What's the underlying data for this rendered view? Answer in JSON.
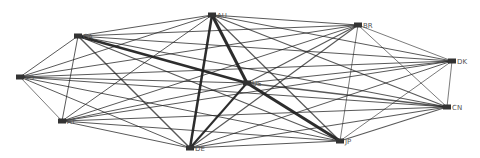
{
  "diagram": {
    "type": "network-graph",
    "node_color": "#333333",
    "label_color": "#555555",
    "edge_color": "#222222",
    "nodes": [
      {
        "id": "AU",
        "label": "AU",
        "x": 212,
        "y": 15
      },
      {
        "id": "CA",
        "label": "CA",
        "x": 78,
        "y": 36
      },
      {
        "id": "ES",
        "label": "ES",
        "x": 20,
        "y": 77
      },
      {
        "id": "AT",
        "label": "AT",
        "x": 62,
        "y": 121
      },
      {
        "id": "DE",
        "label": "DE",
        "x": 190,
        "y": 148
      },
      {
        "id": "US",
        "label": "US",
        "x": 247,
        "y": 83
      },
      {
        "id": "BR",
        "label": "BR",
        "x": 358,
        "y": 25
      },
      {
        "id": "DK",
        "label": "DK",
        "x": 452,
        "y": 61
      },
      {
        "id": "CN",
        "label": "CN",
        "x": 447,
        "y": 107
      },
      {
        "id": "JP",
        "label": "JP",
        "x": 340,
        "y": 141
      }
    ],
    "edges": [
      {
        "source": "AU",
        "target": "CA",
        "weight": 1
      },
      {
        "source": "AU",
        "target": "ES",
        "weight": 1
      },
      {
        "source": "AU",
        "target": "AT",
        "weight": 1
      },
      {
        "source": "AU",
        "target": "DE",
        "weight": 2.5
      },
      {
        "source": "AU",
        "target": "US",
        "weight": 3
      },
      {
        "source": "AU",
        "target": "BR",
        "weight": 1
      },
      {
        "source": "AU",
        "target": "DK",
        "weight": 1
      },
      {
        "source": "AU",
        "target": "CN",
        "weight": 1.2
      },
      {
        "source": "AU",
        "target": "JP",
        "weight": 1.2
      },
      {
        "source": "CA",
        "target": "ES",
        "weight": 1
      },
      {
        "source": "CA",
        "target": "AT",
        "weight": 1
      },
      {
        "source": "CA",
        "target": "DE",
        "weight": 1.4
      },
      {
        "source": "CA",
        "target": "US",
        "weight": 2.5
      },
      {
        "source": "CA",
        "target": "BR",
        "weight": 1
      },
      {
        "source": "CA",
        "target": "DK",
        "weight": 1
      },
      {
        "source": "CA",
        "target": "CN",
        "weight": 1.2
      },
      {
        "source": "CA",
        "target": "JP",
        "weight": 1.2
      },
      {
        "source": "ES",
        "target": "AT",
        "weight": 0.8
      },
      {
        "source": "ES",
        "target": "DE",
        "weight": 1
      },
      {
        "source": "ES",
        "target": "US",
        "weight": 1.2
      },
      {
        "source": "ES",
        "target": "BR",
        "weight": 1
      },
      {
        "source": "ES",
        "target": "DK",
        "weight": 1
      },
      {
        "source": "ES",
        "target": "CN",
        "weight": 1.2
      },
      {
        "source": "ES",
        "target": "JP",
        "weight": 1
      },
      {
        "source": "AT",
        "target": "DE",
        "weight": 1
      },
      {
        "source": "AT",
        "target": "US",
        "weight": 1
      },
      {
        "source": "AT",
        "target": "BR",
        "weight": 1
      },
      {
        "source": "AT",
        "target": "DK",
        "weight": 1
      },
      {
        "source": "AT",
        "target": "CN",
        "weight": 1
      },
      {
        "source": "AT",
        "target": "JP",
        "weight": 1
      },
      {
        "source": "DE",
        "target": "US",
        "weight": 2
      },
      {
        "source": "DE",
        "target": "BR",
        "weight": 1.2
      },
      {
        "source": "DE",
        "target": "DK",
        "weight": 1
      },
      {
        "source": "DE",
        "target": "CN",
        "weight": 1.2
      },
      {
        "source": "DE",
        "target": "JP",
        "weight": 1.2
      },
      {
        "source": "US",
        "target": "BR",
        "weight": 1.2
      },
      {
        "source": "US",
        "target": "DK",
        "weight": 1.2
      },
      {
        "source": "US",
        "target": "CN",
        "weight": 1.4
      },
      {
        "source": "US",
        "target": "JP",
        "weight": 3
      },
      {
        "source": "BR",
        "target": "DK",
        "weight": 0.8
      },
      {
        "source": "BR",
        "target": "CN",
        "weight": 0.8
      },
      {
        "source": "BR",
        "target": "JP",
        "weight": 0.8
      },
      {
        "source": "DK",
        "target": "CN",
        "weight": 0.8
      },
      {
        "source": "DK",
        "target": "JP",
        "weight": 0.8
      },
      {
        "source": "CN",
        "target": "JP",
        "weight": 1.2
      }
    ]
  }
}
